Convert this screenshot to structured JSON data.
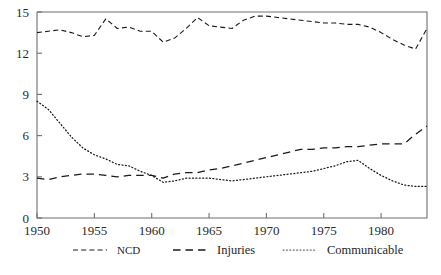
{
  "chart_data": {
    "type": "line",
    "title": "",
    "xlabel": "",
    "ylabel": "",
    "xlim": [
      1950,
      1984
    ],
    "ylim": [
      0,
      15
    ],
    "grid": false,
    "legend_position": "bottom",
    "yticks": [
      0,
      3,
      6,
      9,
      12,
      15
    ],
    "ytick_labels": [
      "0",
      "3",
      "6",
      "9",
      "12",
      "15"
    ],
    "xticks": [
      1950,
      1955,
      1960,
      1965,
      1970,
      1975,
      1980
    ],
    "xtick_labels": [
      "1950",
      "1955",
      "1960",
      "1965",
      "1970",
      "1975",
      "1980"
    ],
    "x": [
      1950,
      1951,
      1952,
      1953,
      1954,
      1955,
      1956,
      1957,
      1958,
      1959,
      1960,
      1961,
      1962,
      1963,
      1964,
      1965,
      1966,
      1967,
      1968,
      1969,
      1970,
      1971,
      1972,
      1973,
      1974,
      1975,
      1976,
      1977,
      1978,
      1979,
      1980,
      1981,
      1982,
      1983,
      1984
    ],
    "series": [
      {
        "name": "NCD",
        "style": "short-dash",
        "color": "#1a1a1a",
        "values": [
          13.5,
          13.6,
          13.7,
          13.5,
          13.2,
          13.3,
          14.5,
          13.8,
          13.9,
          13.6,
          13.6,
          12.8,
          13.1,
          13.8,
          14.6,
          14.0,
          13.9,
          13.8,
          14.4,
          14.7,
          14.7,
          14.6,
          14.5,
          14.4,
          14.3,
          14.2,
          14.2,
          14.1,
          14.1,
          13.9,
          13.5,
          13.0,
          12.6,
          12.3,
          13.8
        ]
      },
      {
        "name": "Injuries",
        "style": "long-dash",
        "color": "#1a1a1a",
        "values": [
          2.9,
          2.8,
          3.0,
          3.1,
          3.2,
          3.2,
          3.1,
          3.0,
          3.1,
          3.1,
          3.1,
          2.9,
          3.2,
          3.3,
          3.3,
          3.5,
          3.6,
          3.8,
          4.0,
          4.2,
          4.4,
          4.6,
          4.8,
          5.0,
          5.0,
          5.1,
          5.1,
          5.2,
          5.2,
          5.3,
          5.4,
          5.4,
          5.4,
          6.1,
          6.7
        ]
      },
      {
        "name": "Communicable",
        "style": "dotted",
        "color": "#6a6a6a",
        "values": [
          8.5,
          7.9,
          6.9,
          5.9,
          5.1,
          4.6,
          4.3,
          3.9,
          3.8,
          3.4,
          3.1,
          2.6,
          2.7,
          2.9,
          2.9,
          2.9,
          2.8,
          2.7,
          2.8,
          2.9,
          3.0,
          3.1,
          3.2,
          3.3,
          3.4,
          3.6,
          3.8,
          4.1,
          4.2,
          3.6,
          3.1,
          2.7,
          2.4,
          2.3,
          2.3
        ]
      }
    ]
  },
  "legend": {
    "items": [
      {
        "label": "NCD",
        "style": "short-dash"
      },
      {
        "label": "Injuries",
        "style": "long-dash"
      },
      {
        "label": "Communicable",
        "style": "dotted"
      }
    ]
  }
}
